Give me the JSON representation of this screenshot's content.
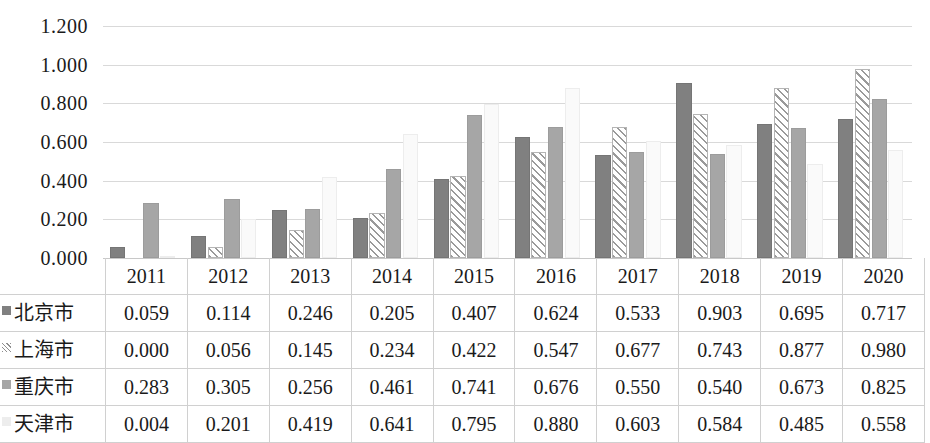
{
  "chart_data": {
    "type": "bar",
    "title": "",
    "xlabel": "",
    "ylabel": "",
    "ylim": [
      0,
      1.2
    ],
    "ytick_step": 0.2,
    "grid": true,
    "legend_position": "table-row-headers",
    "categories": [
      "2011",
      "2012",
      "2013",
      "2014",
      "2015",
      "2016",
      "2017",
      "2018",
      "2019",
      "2020"
    ],
    "series": [
      {
        "name": "北京市",
        "marker": "dark-gray-solid",
        "color": "#808080",
        "values": [
          0.059,
          0.114,
          0.246,
          0.205,
          0.407,
          0.624,
          0.533,
          0.903,
          0.695,
          0.717
        ],
        "labels": [
          "0.059",
          "0.114",
          "0.246",
          "0.205",
          "0.407",
          "0.624",
          "0.533",
          "0.903",
          "0.695",
          "0.717"
        ]
      },
      {
        "name": "上海市",
        "marker": "diagonal-hatch",
        "color": "#ffffff",
        "values": [
          0.0,
          0.056,
          0.145,
          0.234,
          0.422,
          0.547,
          0.677,
          0.743,
          0.877,
          0.98
        ],
        "labels": [
          "0.000",
          "0.056",
          "0.145",
          "0.234",
          "0.422",
          "0.547",
          "0.677",
          "0.743",
          "0.877",
          "0.980"
        ]
      },
      {
        "name": "重庆市",
        "marker": "medium-gray-solid",
        "color": "#a6a6a6",
        "values": [
          0.283,
          0.305,
          0.256,
          0.461,
          0.741,
          0.676,
          0.55,
          0.54,
          0.673,
          0.825
        ],
        "labels": [
          "0.283",
          "0.305",
          "0.256",
          "0.461",
          "0.741",
          "0.676",
          "0.550",
          "0.540",
          "0.673",
          "0.825"
        ]
      },
      {
        "name": "天津市",
        "marker": "light-gray-solid",
        "color": "#fafafa",
        "values": [
          0.004,
          0.201,
          0.419,
          0.641,
          0.795,
          0.88,
          0.603,
          0.584,
          0.485,
          0.558
        ],
        "labels": [
          "0.004",
          "0.201",
          "0.419",
          "0.641",
          "0.795",
          "0.880",
          "0.603",
          "0.584",
          "0.485",
          "0.558"
        ]
      }
    ],
    "ytick_labels": [
      "1.200",
      "1.000",
      "0.800",
      "0.600",
      "0.400",
      "0.200",
      "0.000"
    ],
    "ytick_values": [
      1.2,
      1.0,
      0.8,
      0.6,
      0.4,
      0.2,
      0.0
    ]
  }
}
